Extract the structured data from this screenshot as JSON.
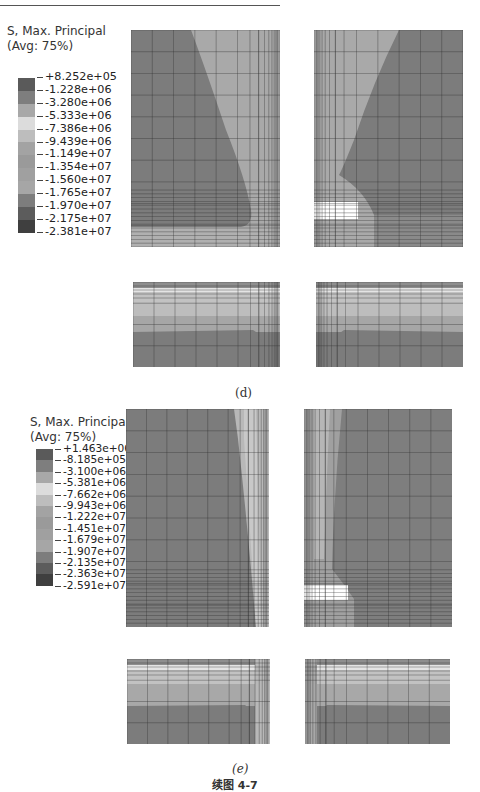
{
  "figure": {
    "title": "续图 4-7",
    "subfigures": [
      {
        "caption": "(d)",
        "legend": {
          "title_line1": "S, Max. Principal",
          "title_line2": "(Avg: 75%)",
          "values": [
            "+8.252e+05",
            "-1.228e+06",
            "-3.280e+06",
            "-5.333e+06",
            "-7.386e+06",
            "-9.439e+06",
            "-1.149e+07",
            "-1.354e+07",
            "-1.560e+07",
            "-1.765e+07",
            "-1.970e+07",
            "-2.175e+07",
            "-2.381e+07"
          ],
          "colors": [
            "#5a5a5a",
            "#7e7e7e",
            "#a8a8a8",
            "#dcdcdc",
            "#bdbdbd",
            "#a3a3a3",
            "#9a9a9a",
            "#a0a0a0",
            "#a6a6a6",
            "#7d7d7d",
            "#5c5c5c",
            "#3f3f3f"
          ]
        }
      },
      {
        "caption": "(e)",
        "legend": {
          "title_line1": "S, Max. Principal",
          "title_line2": "(Avg: 75%)",
          "values": [
            "+1.463e+06",
            "-8.185e+05",
            "-3.100e+06",
            "-5.381e+06",
            "-7.662e+06",
            "-9.943e+06",
            "-1.222e+07",
            "-1.451e+07",
            "-1.679e+07",
            "-1.907e+07",
            "-2.135e+07",
            "-2.363e+07",
            "-2.591e+07"
          ],
          "colors": [
            "#5a5a5a",
            "#7e7e7e",
            "#a8a8a8",
            "#dcdcdc",
            "#bdbdbd",
            "#a3a3a3",
            "#9a9a9a",
            "#a0a0a0",
            "#a6a6a6",
            "#7d7d7d",
            "#5c5c5c",
            "#3f3f3f"
          ]
        }
      }
    ]
  },
  "colors": {
    "contour_dark": "#7c7c7c",
    "contour_mid": "#9e9e9e",
    "contour_light": "#bcbcbc",
    "contour_highlight": "#e2e2e2",
    "mesh_line": "#2f2f2f"
  }
}
